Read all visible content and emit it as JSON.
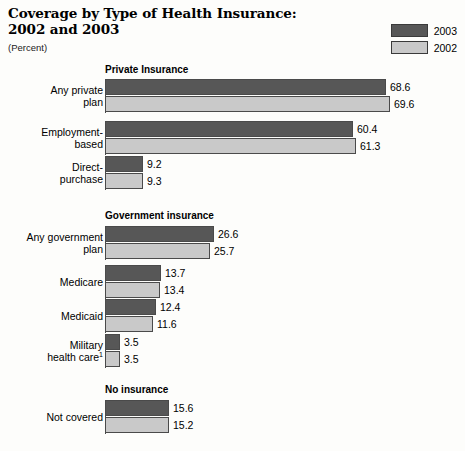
{
  "header": {
    "title_line1": "Coverage by Type of Health Insurance:",
    "title_line2": "2002 and 2003",
    "subtitle": "(Percent)"
  },
  "legend": {
    "items": [
      {
        "label": "2003",
        "color": "#575757",
        "swatch_name": "legend-swatch-2003"
      },
      {
        "label": "2002",
        "color": "#c9c9c9",
        "swatch_name": "legend-swatch-2002"
      }
    ]
  },
  "chart_data": {
    "type": "bar",
    "orientation": "horizontal",
    "title": "Coverage by Type of Health Insurance: 2002 and 2003",
    "subtitle": "(Percent)",
    "xlabel": "",
    "ylabel": "",
    "unit": "percent",
    "grid": false,
    "legend_position": "top-right",
    "xlim": [
      0,
      72
    ],
    "series": [
      {
        "name": "2003",
        "color": "#575757"
      },
      {
        "name": "2002",
        "color": "#c9c9c9"
      }
    ],
    "sections": [
      {
        "name": "Private Insurance",
        "categories": [
          "Any private plan",
          "Employment-based",
          "Direct-purchase"
        ],
        "values_2003": [
          68.6,
          60.4,
          9.2
        ],
        "values_2002": [
          69.6,
          61.3,
          9.3
        ]
      },
      {
        "name": "Government insurance",
        "categories": [
          "Any government plan",
          "Medicare",
          "Medicaid",
          "Military health care"
        ],
        "values_2003": [
          26.6,
          13.7,
          12.4,
          3.5
        ],
        "values_2002": [
          25.7,
          13.4,
          11.6,
          3.5
        ]
      },
      {
        "name": "No insurance",
        "categories": [
          "Not covered"
        ],
        "values_2003": [
          15.6
        ],
        "values_2002": [
          15.2
        ]
      }
    ],
    "footnote_markers": {
      "Military health care": "1"
    }
  },
  "sections": [
    {
      "title": "Private Insurance",
      "title_top": 64,
      "groups": [
        {
          "label_line1": "Any private",
          "label_line2": "plan",
          "top": 79,
          "bars": [
            {
              "series": "2003",
              "value": "68.6",
              "px": 281
            },
            {
              "series": "2002",
              "value": "69.6",
              "px": 285
            }
          ]
        },
        {
          "label_line1": "Employment-",
          "label_line2": "based",
          "top": 121,
          "bars": [
            {
              "series": "2003",
              "value": "60.4",
              "px": 248
            },
            {
              "series": "2002",
              "value": "61.3",
              "px": 251
            }
          ]
        },
        {
          "label_line1": "Direct-",
          "label_line2": "purchase",
          "top": 156,
          "bars": [
            {
              "series": "2003",
              "value": "9.2",
              "px": 38
            },
            {
              "series": "2002",
              "value": "9.3",
              "px": 38
            }
          ]
        }
      ]
    },
    {
      "title": "Government insurance",
      "title_top": 210,
      "groups": [
        {
          "label_line1": "Any government",
          "label_line2": "plan",
          "top": 226,
          "bars": [
            {
              "series": "2003",
              "value": "26.6",
              "px": 109
            },
            {
              "series": "2002",
              "value": "25.7",
              "px": 105
            }
          ]
        },
        {
          "label_line1": "Medicare",
          "label_line2": "",
          "top": 265,
          "bars": [
            {
              "series": "2003",
              "value": "13.7",
              "px": 56
            },
            {
              "series": "2002",
              "value": "13.4",
              "px": 55
            }
          ]
        },
        {
          "label_line1": "Medicaid",
          "label_line2": "",
          "top": 299,
          "bars": [
            {
              "series": "2003",
              "value": "12.4",
              "px": 51
            },
            {
              "series": "2002",
              "value": "11.6",
              "px": 48
            }
          ]
        },
        {
          "label_line1": "Military",
          "label_line2": "health care",
          "label_sup": "1",
          "top": 334,
          "bars": [
            {
              "series": "2003",
              "value": "3.5",
              "px": 15
            },
            {
              "series": "2002",
              "value": "3.5",
              "px": 15
            }
          ]
        }
      ]
    },
    {
      "title": "No insurance",
      "title_top": 384,
      "groups": [
        {
          "label_line1": "Not covered",
          "label_line2": "",
          "top": 400,
          "bars": [
            {
              "series": "2003",
              "value": "15.6",
              "px": 64
            },
            {
              "series": "2002",
              "value": "15.2",
              "px": 64
            }
          ]
        }
      ]
    }
  ]
}
